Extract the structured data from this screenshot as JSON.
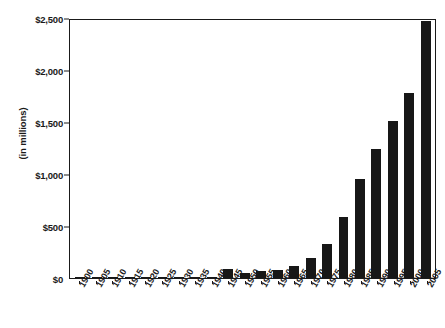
{
  "chart_data": {
    "type": "bar",
    "title": "",
    "xlabel": "",
    "ylabel": "(in millions)",
    "ylim": [
      0,
      2500
    ],
    "yticks": [
      0,
      500,
      1000,
      1500,
      2000,
      2500
    ],
    "ytick_labels": [
      "$0",
      "$500",
      "$1,000",
      "$1,500",
      "$2,000",
      "$2,500"
    ],
    "grid": false,
    "legend": "none",
    "bar_color": "#171717",
    "axis_color": "#1a1a1a",
    "categories": [
      "1900",
      "1905",
      "1910",
      "1915",
      "1920",
      "1925",
      "1930",
      "1935",
      "1940",
      "1945",
      "1950",
      "1955",
      "1960",
      "1965",
      "1970",
      "1975",
      "1980",
      "1985",
      "1990",
      "1995",
      "2000",
      "2005"
    ],
    "values": [
      2,
      2,
      3,
      4,
      4,
      5,
      5,
      6,
      12,
      85,
      45,
      70,
      80,
      120,
      190,
      330,
      590,
      950,
      1240,
      1510,
      1780,
      2470
    ]
  }
}
